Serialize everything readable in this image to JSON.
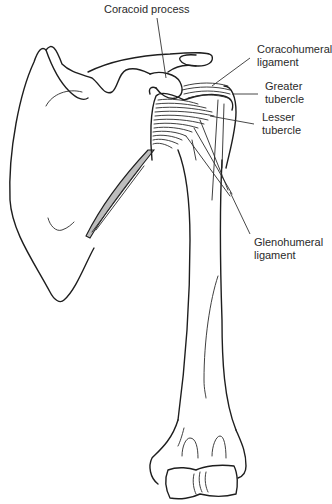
{
  "figure": {
    "type": "anatomical-illustration",
    "line_color": "#1e1e1e",
    "background": "#ffffff"
  },
  "labels": {
    "coracoid_process": {
      "lines": [
        "Coracoid process"
      ]
    },
    "coracohumeral_ligament": {
      "lines": [
        "Coracohumeral",
        "ligament"
      ]
    },
    "greater_tubercle": {
      "lines": [
        "Greater",
        "tubercle"
      ]
    },
    "lesser_tubercle": {
      "lines": [
        "Lesser",
        "tubercle"
      ]
    },
    "glenohumeral_ligament": {
      "lines": [
        "Glenohumeral",
        "ligament"
      ]
    }
  }
}
